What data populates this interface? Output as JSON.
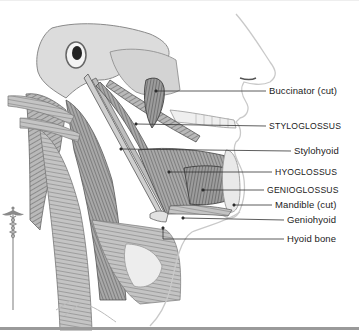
{
  "figure": {
    "labels": [
      {
        "id": "buccinator",
        "text": "Buccinator (cut)",
        "caps": false,
        "y": 91,
        "x_text": 269,
        "line_from_x": 156,
        "line_from_y": 91
      },
      {
        "id": "styloglossus",
        "text": "STYLOGLOSSUS",
        "caps": true,
        "y": 126,
        "x_text": 269,
        "line_from_x": 136,
        "line_from_y": 124
      },
      {
        "id": "stylohyoid",
        "text": "Stylohyoid",
        "caps": false,
        "y": 151,
        "x_text": 294,
        "line_from_x": 121,
        "line_from_y": 149
      },
      {
        "id": "hyoglossus",
        "text": "HYOGLOSSUS",
        "caps": true,
        "y": 172,
        "x_text": 275,
        "line_from_x": 169,
        "line_from_y": 172
      },
      {
        "id": "genioglossus",
        "text": "GENIOGLOSSUS",
        "caps": true,
        "y": 190,
        "x_text": 267,
        "line_from_x": 203,
        "line_from_y": 190
      },
      {
        "id": "mandible",
        "text": "Mandible (cut)",
        "caps": false,
        "y": 205,
        "x_text": 275,
        "line_from_x": 234,
        "line_from_y": 205
      },
      {
        "id": "geniohyoid",
        "text": "Geniohyoid",
        "caps": false,
        "y": 220,
        "x_text": 287,
        "line_from_x": 183,
        "line_from_y": 218
      },
      {
        "id": "hyoid",
        "text": "Hyoid bone",
        "caps": false,
        "y": 239,
        "x_text": 287,
        "line_from_x": 163,
        "line_from_y": 228
      }
    ],
    "colors": {
      "line": "#333333",
      "text": "#222222",
      "rule": "#9a9a9a",
      "muscle_dark": "#555555",
      "muscle_mid": "#8a8a8a",
      "bone": "#d9d9d9",
      "skin_outline": "#bdbdbd"
    }
  },
  "logo": {
    "icon": "caduceus-icon"
  }
}
